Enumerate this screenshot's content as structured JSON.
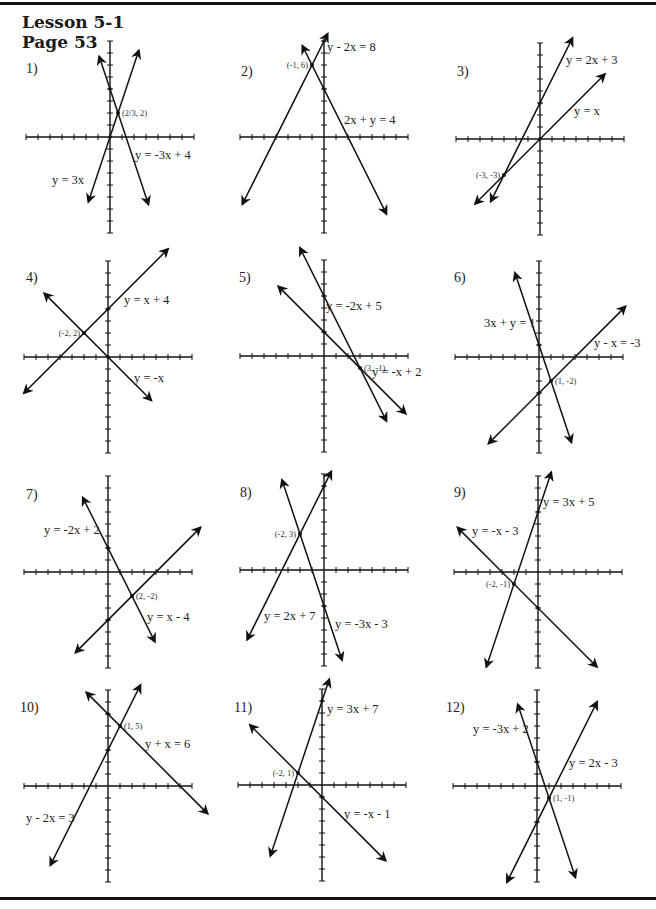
{
  "header": {
    "lesson": "Lesson 5-1",
    "page": "Page 53"
  },
  "layout": {
    "scale_px_per_unit": 12,
    "line_color": "#111111",
    "ink_color": "#222222"
  },
  "chart_data": [
    {
      "type": "line",
      "title": "1)",
      "problem": 1,
      "origin": [
        110,
        137
      ],
      "xrange": [
        -7,
        7
      ],
      "yrange": [
        -8,
        8
      ],
      "series": [
        {
          "name": "y = 3x",
          "m": 3,
          "b": 0,
          "x": [
            -1.8,
            2.4
          ]
        },
        {
          "name": "y = -3x + 4",
          "m": -3,
          "b": 4,
          "x": [
            -0.9,
            3.2
          ]
        }
      ],
      "intersection": {
        "label": "(2/3, 2)",
        "x": 0.6667,
        "y": 2
      },
      "labels": [
        {
          "text": "y = 3x",
          "x": 52,
          "y": 184
        },
        {
          "text": "y = -3x + 4",
          "x": 135,
          "y": 159
        }
      ]
    },
    {
      "type": "line",
      "title": "2)",
      "problem": 2,
      "origin": [
        324,
        137
      ],
      "xrange": [
        -7,
        7
      ],
      "yrange": [
        -8,
        8
      ],
      "series": [
        {
          "name": "y - 2x = 8",
          "m": 2,
          "b": 8,
          "x": [
            -6.8,
            0.3
          ]
        },
        {
          "name": "2x + y = 4",
          "m": -2,
          "b": 4,
          "x": [
            -1.8,
            5.2
          ]
        }
      ],
      "intersection": {
        "label": "(-1, 6)",
        "x": -1,
        "y": 6
      },
      "labels": [
        {
          "text": "y - 2x = 8",
          "x": 327,
          "y": 51
        },
        {
          "text": "2x + y = 4",
          "x": 344,
          "y": 124
        }
      ]
    },
    {
      "type": "line",
      "title": "3)",
      "problem": 3,
      "origin": [
        540,
        139
      ],
      "xrange": [
        -7,
        7
      ],
      "yrange": [
        -8,
        8
      ],
      "series": [
        {
          "name": "y = 2x + 3",
          "m": 2,
          "b": 3,
          "x": [
            -4.1,
            2.7
          ]
        },
        {
          "name": "y = x",
          "m": 1,
          "b": 0,
          "x": [
            -5.4,
            5.4
          ]
        }
      ],
      "intersection": {
        "label": "(-3, -3)",
        "x": -3,
        "y": -3
      },
      "labels": [
        {
          "text": "y = 2x + 3",
          "x": 566,
          "y": 64
        },
        {
          "text": "y = x",
          "x": 574,
          "y": 115
        }
      ]
    },
    {
      "type": "line",
      "title": "4)",
      "problem": 4,
      "origin": [
        108,
        357
      ],
      "xrange": [
        -7,
        7
      ],
      "yrange": [
        -8,
        8
      ],
      "series": [
        {
          "name": "y = x + 4",
          "m": 1,
          "b": 4,
          "x": [
            -7,
            5
          ]
        },
        {
          "name": "y = -x",
          "m": -1,
          "b": 0,
          "x": [
            -5.3,
            3.6
          ]
        }
      ],
      "intersection": {
        "label": "(-2, 2)",
        "x": -2,
        "y": 2
      },
      "labels": [
        {
          "text": "y = x + 4",
          "x": 124,
          "y": 304
        },
        {
          "text": "y = -x",
          "x": 134,
          "y": 382
        }
      ]
    },
    {
      "type": "line",
      "title": "5)",
      "problem": 5,
      "origin": [
        324,
        356
      ],
      "xrange": [
        -7,
        7
      ],
      "yrange": [
        -8,
        8
      ],
      "series": [
        {
          "name": "y = -2x + 5",
          "m": -2,
          "b": 5,
          "x": [
            -2,
            5.2
          ]
        },
        {
          "name": "y = -x + 2",
          "m": -1,
          "b": 2,
          "x": [
            -3.8,
            6.8
          ]
        }
      ],
      "intersection": {
        "label": "(3, -1)",
        "x": 3,
        "y": -1
      },
      "labels": [
        {
          "text": "y = -2x + 5",
          "x": 326,
          "y": 310
        },
        {
          "text": "y = -x + 2",
          "x": 372,
          "y": 376
        }
      ]
    },
    {
      "type": "line",
      "title": "6)",
      "problem": 6,
      "origin": [
        539,
        357
      ],
      "xrange": [
        -7,
        7
      ],
      "yrange": [
        -8,
        8
      ],
      "series": [
        {
          "name": "3x + y = 1",
          "m": -3,
          "b": 1,
          "x": [
            -2,
            2.7
          ]
        },
        {
          "name": "y - x = -3",
          "m": 1,
          "b": -3,
          "x": [
            -4.2,
            7.2
          ]
        }
      ],
      "intersection": {
        "label": "(1, -2)",
        "x": 1,
        "y": -2
      },
      "labels": [
        {
          "text": "3x + y = 1",
          "x": 484,
          "y": 327
        },
        {
          "text": "y - x = -3",
          "x": 594,
          "y": 347
        }
      ]
    },
    {
      "type": "line",
      "title": "7)",
      "problem": 7,
      "origin": [
        108,
        572
      ],
      "xrange": [
        -7,
        7
      ],
      "yrange": [
        -8,
        8
      ],
      "series": [
        {
          "name": "y = -2x + 2",
          "m": -2,
          "b": 2,
          "x": [
            -2.1,
            3.9
          ]
        },
        {
          "name": "y = x - 4",
          "m": 1,
          "b": -4,
          "x": [
            -2.7,
            7.7
          ]
        }
      ],
      "intersection": {
        "label": "(2, -2)",
        "x": 2,
        "y": -2
      },
      "labels": [
        {
          "text": "y = -2x + 2",
          "x": 44,
          "y": 534
        },
        {
          "text": "y = x - 4",
          "x": 147,
          "y": 621
        }
      ]
    },
    {
      "type": "line",
      "title": "8)",
      "problem": 8,
      "origin": [
        324,
        570
      ],
      "xrange": [
        -7,
        7
      ],
      "yrange": [
        -8,
        8
      ],
      "series": [
        {
          "name": "y = 2x + 7",
          "m": 2,
          "b": 7,
          "x": [
            -6.4,
            0.6
          ]
        },
        {
          "name": "y = -3x - 3",
          "m": -3,
          "b": -3,
          "x": [
            -3.5,
            1.5
          ]
        }
      ],
      "intersection": {
        "label": "(-2, 3)",
        "x": -2,
        "y": 3
      },
      "labels": [
        {
          "text": "y = 2x + 7",
          "x": 264,
          "y": 620
        },
        {
          "text": "y = -3x - 3",
          "x": 335,
          "y": 628
        }
      ]
    },
    {
      "type": "line",
      "title": "9)",
      "problem": 9,
      "origin": [
        538,
        572
      ],
      "xrange": [
        -7,
        7
      ],
      "yrange": [
        -8,
        8
      ],
      "series": [
        {
          "name": "y = 3x + 5",
          "m": 3,
          "b": 5,
          "x": [
            -4.3,
            1.1
          ]
        },
        {
          "name": "y = -x - 3",
          "m": -1,
          "b": -3,
          "x": [
            -6.7,
            4.9
          ]
        }
      ],
      "intersection": {
        "label": "(-2, -1)",
        "x": -2,
        "y": -1
      },
      "labels": [
        {
          "text": "y = 3x + 5",
          "x": 543,
          "y": 506
        },
        {
          "text": "y = -x - 3",
          "x": 472,
          "y": 535
        }
      ]
    },
    {
      "type": "line",
      "title": "10)",
      "problem": 10,
      "origin": [
        108,
        786
      ],
      "xrange": [
        -7,
        7
      ],
      "yrange": [
        -8,
        8
      ],
      "series": [
        {
          "name": "y - 2x = 3",
          "m": 2,
          "b": 3,
          "x": [
            -4.8,
            2.7
          ]
        },
        {
          "name": "y + x = 6",
          "m": -1,
          "b": 6,
          "x": [
            -1.8,
            8.3
          ]
        }
      ],
      "intersection": {
        "label": "(1, 5)",
        "x": 1,
        "y": 5
      },
      "labels": [
        {
          "text": "y + x = 6",
          "x": 145,
          "y": 748
        },
        {
          "text": "y - 2x = 3",
          "x": 26,
          "y": 822
        }
      ]
    },
    {
      "type": "line",
      "title": "11)",
      "problem": 11,
      "origin": [
        322,
        785
      ],
      "xrange": [
        -7,
        7
      ],
      "yrange": [
        -8,
        8
      ],
      "series": [
        {
          "name": "y = 3x + 7",
          "m": 3,
          "b": 7,
          "x": [
            -4.3,
            0.6
          ]
        },
        {
          "name": "y = -x - 1",
          "m": -1,
          "b": -1,
          "x": [
            -6,
            5.3
          ]
        }
      ],
      "intersection": {
        "label": "(-2, 1)",
        "x": -2,
        "y": 1
      },
      "labels": [
        {
          "text": "y = 3x + 7",
          "x": 327,
          "y": 713
        },
        {
          "text": "y = -x - 1",
          "x": 344,
          "y": 818
        }
      ]
    },
    {
      "type": "line",
      "title": "12)",
      "problem": 12,
      "origin": [
        537,
        786
      ],
      "xrange": [
        -7,
        7
      ],
      "yrange": [
        -8,
        8
      ],
      "series": [
        {
          "name": "y = -3x + 2",
          "m": -3,
          "b": 2,
          "x": [
            -1.6,
            3.2
          ]
        },
        {
          "name": "y = 2x - 3",
          "m": 2,
          "b": -3,
          "x": [
            -2.5,
            5
          ]
        }
      ],
      "intersection": {
        "label": "(1, -1)",
        "x": 1,
        "y": -1
      },
      "labels": [
        {
          "text": "y = -3x + 2",
          "x": 473,
          "y": 733
        },
        {
          "text": "y = 2x - 3",
          "x": 569,
          "y": 767
        }
      ]
    }
  ],
  "problem_labels": [
    {
      "text": "1)",
      "x": 26,
      "y": 73
    },
    {
      "text": "2)",
      "x": 241,
      "y": 76
    },
    {
      "text": "3)",
      "x": 457,
      "y": 76
    },
    {
      "text": "4)",
      "x": 26,
      "y": 282
    },
    {
      "text": "5)",
      "x": 239,
      "y": 282
    },
    {
      "text": "6)",
      "x": 454,
      "y": 282
    },
    {
      "text": "7)",
      "x": 26,
      "y": 499
    },
    {
      "text": "8)",
      "x": 240,
      "y": 497
    },
    {
      "text": "9)",
      "x": 454,
      "y": 497
    },
    {
      "text": "10)",
      "x": 20,
      "y": 712
    },
    {
      "text": "11)",
      "x": 234,
      "y": 712
    },
    {
      "text": "12)",
      "x": 446,
      "y": 712
    }
  ]
}
